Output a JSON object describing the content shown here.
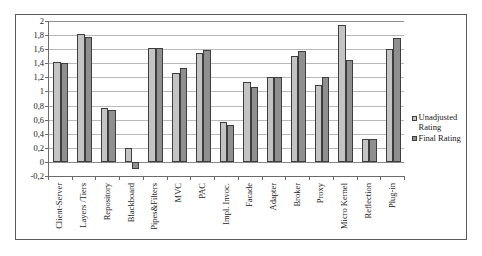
{
  "chart_data": {
    "type": "bar",
    "title": "",
    "subtitle": "",
    "xlabel": "",
    "ylabel": "",
    "ylim": [
      -0.2,
      2
    ],
    "ytick_labels": [
      "2",
      "1,8",
      "1,6",
      "1,4",
      "1,2",
      "1",
      "0,8",
      "0,6",
      "0,4",
      "0,2",
      "0",
      "-0,2"
    ],
    "ytick_values": [
      2,
      1.8,
      1.6,
      1.4,
      1.2,
      1,
      0.8,
      0.6,
      0.4,
      0.2,
      0,
      -0.2
    ],
    "grid": true,
    "legend_position": "right",
    "categories": [
      "Client-Server",
      "Layers /Tiers",
      "Repository",
      "Blackboard",
      "Pipes&Filters",
      "MVC",
      "PAC",
      "Impl. Invoc.",
      "Facade",
      "Adapter",
      "Broker",
      "Proxy",
      "Micro Kernel",
      "Reflection",
      "Plug-in"
    ],
    "series": [
      {
        "name": "Unadjusted Rating",
        "color": "#c4c4c4",
        "values": [
          1.42,
          1.81,
          0.76,
          0.2,
          1.61,
          1.26,
          1.54,
          0.57,
          1.13,
          1.2,
          1.5,
          1.09,
          1.95,
          0.33,
          1.6
        ]
      },
      {
        "name": "Final Rating",
        "color": "#8f8f8f",
        "values": [
          1.41,
          1.77,
          0.73,
          -0.1,
          1.61,
          1.33,
          1.59,
          0.52,
          1.07,
          1.2,
          1.57,
          1.2,
          1.45,
          0.33,
          1.76
        ]
      }
    ]
  },
  "legend": {
    "entries": [
      {
        "label_line1": "Unadjusted",
        "label_line2": "Rating"
      },
      {
        "label_line1": "Final Rating",
        "label_line2": ""
      }
    ]
  },
  "colors": {
    "unadjusted": "#c4c4c4",
    "final": "#8f8f8f",
    "bar_border": "#3d3d3d",
    "gridline": "#b9b9b9",
    "axis": "#6b6b6b",
    "frame": "#5a5a5a",
    "text": "#1a1a1a"
  }
}
